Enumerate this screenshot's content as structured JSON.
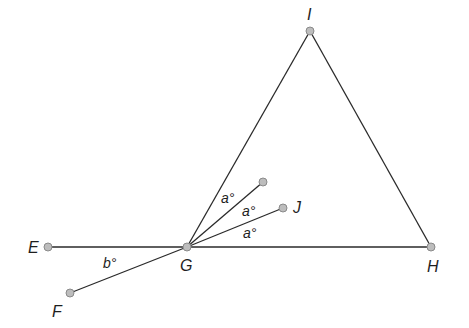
{
  "diagram": {
    "points": [
      {
        "id": "E",
        "label": "E",
        "x": 48,
        "y": 247,
        "label_x": 28,
        "label_y": 253
      },
      {
        "id": "F",
        "label": "F",
        "x": 70,
        "y": 293,
        "label_x": 52,
        "label_y": 317
      },
      {
        "id": "G",
        "label": "G",
        "x": 187,
        "y": 247,
        "label_x": 180,
        "label_y": 271
      },
      {
        "id": "H",
        "label": "H",
        "x": 431,
        "y": 247,
        "label_x": 427,
        "label_y": 272
      },
      {
        "id": "I",
        "label": "I",
        "x": 310,
        "y": 31,
        "label_x": 307,
        "label_y": 20
      },
      {
        "id": "J",
        "label": "J",
        "x": 283,
        "y": 208,
        "label_x": 293,
        "label_y": 213
      },
      {
        "id": "K",
        "label": "",
        "x": 263,
        "y": 182
      }
    ],
    "segments": [
      {
        "from": "E",
        "to": "H"
      },
      {
        "from": "G",
        "to": "I"
      },
      {
        "from": "I",
        "to": "H"
      },
      {
        "from": "G",
        "to": "F"
      },
      {
        "from": "G",
        "to": "K"
      },
      {
        "from": "G",
        "to": "J"
      }
    ],
    "angle_labels": [
      {
        "text": "a°",
        "x": 221,
        "y": 203
      },
      {
        "text": "a°",
        "x": 242,
        "y": 216
      },
      {
        "text": "a°",
        "x": 243,
        "y": 238
      },
      {
        "text": "b°",
        "x": 103,
        "y": 268
      }
    ]
  }
}
